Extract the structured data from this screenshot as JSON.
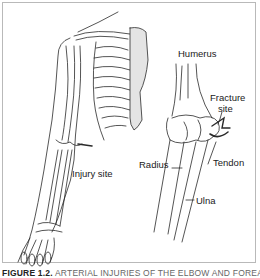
{
  "figure": {
    "labels": {
      "humerus": "Humerus",
      "fracture_site_line1": "Fracture",
      "fracture_site_line2": "site",
      "radius": "Radius",
      "tendon": "Tendon",
      "ulna": "Ulna",
      "injury_site": "Injury site"
    },
    "caption": {
      "prefix": "FIGURE 1.2.",
      "text": "ARTERIAL INJURIES OF THE ELBOW AND FOREARM"
    },
    "colors": {
      "line": "#2a2a2a",
      "frame": "#b9b9b9",
      "background": "#ffffff"
    }
  }
}
